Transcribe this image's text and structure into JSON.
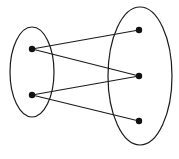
{
  "diagram": {
    "type": "bipartite-mapping",
    "colors": {
      "stroke": "#1a1a1a",
      "node": "#111111",
      "background": "#ffffff"
    },
    "sets": [
      {
        "id": "domain",
        "cx": 32,
        "cy": 72,
        "rx": 22,
        "ry": 45
      },
      {
        "id": "codomain",
        "cx": 140,
        "cy": 76,
        "rx": 32,
        "ry": 69
      }
    ],
    "nodes": [
      {
        "id": "L1",
        "set": "domain",
        "x": 32,
        "y": 49
      },
      {
        "id": "L2",
        "set": "domain",
        "x": 32,
        "y": 95
      },
      {
        "id": "R1",
        "set": "codomain",
        "x": 139,
        "y": 30
      },
      {
        "id": "R2",
        "set": "codomain",
        "x": 139,
        "y": 76
      },
      {
        "id": "R3",
        "set": "codomain",
        "x": 139,
        "y": 121
      }
    ],
    "edges": [
      {
        "from": "L1",
        "to": "R1"
      },
      {
        "from": "L1",
        "to": "R2"
      },
      {
        "from": "L2",
        "to": "R2"
      },
      {
        "from": "L2",
        "to": "R3"
      }
    ]
  }
}
